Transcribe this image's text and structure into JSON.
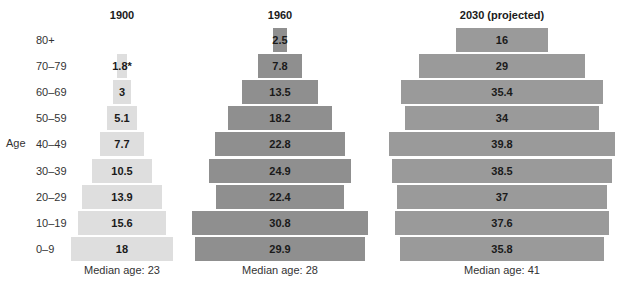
{
  "chart_data": {
    "type": "bar",
    "subtype": "population-pyramid",
    "ylabel": "Age",
    "categories": [
      "80+",
      "70-79",
      "60-69",
      "50-59",
      "40-49",
      "30-39",
      "20-29",
      "10-19",
      "0-9"
    ],
    "series": [
      {
        "name": "1900",
        "values": [
          null,
          1.8,
          3,
          5.1,
          7.7,
          10.5,
          13.9,
          15.6,
          18
        ],
        "labels": [
          "",
          "1.8*",
          "3",
          "5.1",
          "7.7",
          "10.5",
          "13.9",
          "15.6",
          "18"
        ],
        "median_label": "Median age: 23",
        "color": "#dedede"
      },
      {
        "name": "1960",
        "values": [
          2.5,
          7.8,
          13.5,
          18.2,
          22.8,
          24.9,
          22.4,
          30.8,
          29.9
        ],
        "labels": [
          "2.5",
          "7.8",
          "13.5",
          "18.2",
          "22.8",
          "24.9",
          "22.4",
          "30.8",
          "29.9"
        ],
        "median_label": "Median age: 28",
        "color": "#8f8f8f"
      },
      {
        "name": "2030 (projected)",
        "values": [
          16,
          29,
          35.4,
          34,
          39.8,
          38.5,
          37,
          37.6,
          35.8
        ],
        "labels": [
          "16",
          "29",
          "35.4",
          "34",
          "39.8",
          "38.5",
          "37",
          "37.6",
          "35.8"
        ],
        "median_label": "Median age: 41",
        "color": "#9a9a9a"
      }
    ],
    "legend": "none",
    "grid": false
  },
  "layout": {
    "row_top": 28,
    "row_pitch": 26.1,
    "px_per_unit": 5.7,
    "centers": [
      122,
      280,
      502
    ]
  }
}
